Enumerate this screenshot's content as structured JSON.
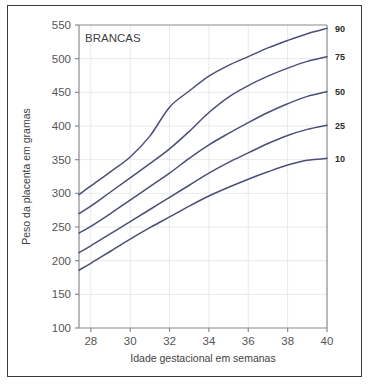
{
  "figure": {
    "border_color": "#3a3a3a",
    "background": "#ffffff"
  },
  "chart_data": {
    "type": "line",
    "title": "BRANCAS",
    "xlabel": "Idade gestacional em semanas",
    "ylabel": "Peso da placenta em gramas",
    "xlim": [
      27.4,
      40
    ],
    "ylim": [
      100,
      550
    ],
    "xticks": [
      28,
      30,
      32,
      34,
      36,
      38,
      40
    ],
    "xtick_labels": [
      "28",
      "30",
      "32",
      "34",
      "36",
      "38",
      "40"
    ],
    "yticks": [
      100,
      150,
      200,
      250,
      300,
      350,
      400,
      450,
      500,
      550
    ],
    "ytick_labels": [
      "100",
      "150",
      "200",
      "250",
      "300",
      "350",
      "400",
      "450",
      "500",
      "550"
    ],
    "grid": true,
    "grid_color": "#e9e9ec",
    "legend": "right-axis-labels",
    "line_color": "#4a4f7a",
    "x": [
      27.4,
      28,
      29,
      30,
      31,
      32,
      33,
      34,
      35,
      36,
      37,
      38,
      39,
      40
    ],
    "series": [
      {
        "name": "90",
        "percentile": 90,
        "right_label": "90",
        "values": [
          298,
          311,
          332,
          354,
          385,
          428,
          452,
          474,
          490,
          503,
          516,
          527,
          537,
          545
        ]
      },
      {
        "name": "75",
        "percentile": 75,
        "right_label": "75",
        "values": [
          270,
          281,
          302,
          323,
          344,
          366,
          392,
          420,
          443,
          460,
          474,
          486,
          496,
          503
        ]
      },
      {
        "name": "50",
        "percentile": 50,
        "right_label": "50",
        "values": [
          241,
          251,
          270,
          290,
          310,
          330,
          352,
          372,
          389,
          405,
          420,
          433,
          444,
          451
        ]
      },
      {
        "name": "25",
        "percentile": 25,
        "right_label": "25",
        "values": [
          212,
          222,
          240,
          258,
          276,
          294,
          312,
          330,
          346,
          360,
          374,
          386,
          395,
          401
        ]
      },
      {
        "name": "10",
        "percentile": 10,
        "right_label": "10",
        "values": [
          186,
          196,
          214,
          232,
          249,
          265,
          281,
          296,
          309,
          321,
          332,
          342,
          349,
          352
        ]
      }
    ],
    "right_axis_labels": [
      "90",
      "75",
      "50",
      "25",
      "10"
    ]
  }
}
